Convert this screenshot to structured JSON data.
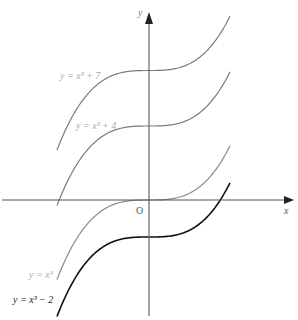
{
  "axes": {
    "x_label": "x",
    "y_label": "y",
    "origin_label": "O"
  },
  "curves": [
    {
      "label": "y = x³ + 7",
      "shift": 7,
      "color": "#7a7a7a"
    },
    {
      "label": "y = x³ + 4",
      "shift": 4,
      "color": "#7a7a7a"
    },
    {
      "label": "y = x³",
      "shift": 0,
      "color": "#8a8a8a"
    },
    {
      "label": "y = x³ − 2",
      "shift": -2,
      "color": "#111111"
    }
  ],
  "label_colors": {
    "gray": "#a8a8a8",
    "dark": "#222222"
  }
}
